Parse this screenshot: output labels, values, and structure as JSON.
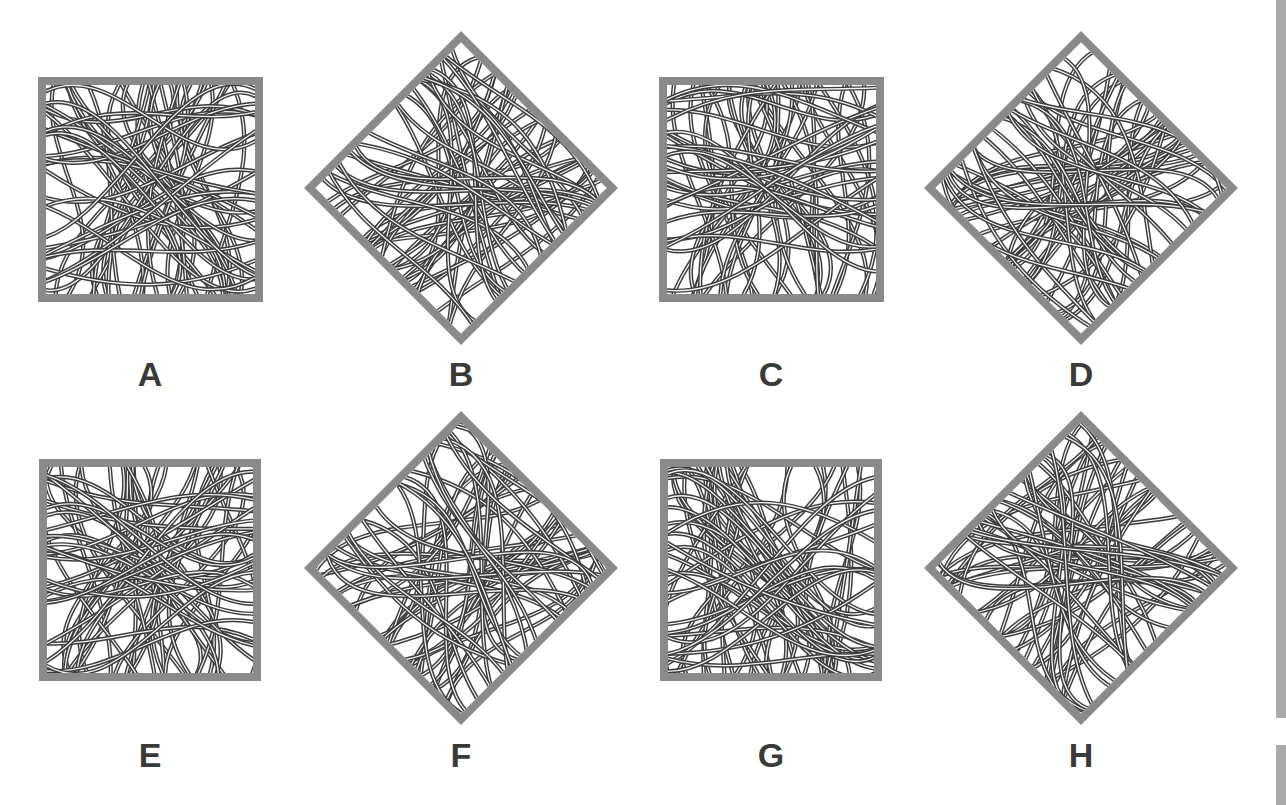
{
  "puzzle": {
    "options": [
      {
        "label": "A",
        "shape": "square",
        "cx": 150,
        "cy": 189,
        "size": 225,
        "seed": 11
      },
      {
        "label": "B",
        "shape": "diamond",
        "cx": 461,
        "cy": 188,
        "size": 222,
        "seed": 23
      },
      {
        "label": "C",
        "shape": "square",
        "cx": 771,
        "cy": 189,
        "size": 225,
        "seed": 37
      },
      {
        "label": "D",
        "shape": "diamond",
        "cx": 1081,
        "cy": 188,
        "size": 222,
        "seed": 41
      },
      {
        "label": "E",
        "shape": "square",
        "cx": 150,
        "cy": 570,
        "size": 222,
        "seed": 53
      },
      {
        "label": "F",
        "shape": "diamond",
        "cx": 461,
        "cy": 568,
        "size": 222,
        "seed": 67
      },
      {
        "label": "G",
        "shape": "square",
        "cx": 771,
        "cy": 570,
        "size": 222,
        "seed": 79
      },
      {
        "label": "H",
        "shape": "diamond",
        "cx": 1081,
        "cy": 568,
        "size": 222,
        "seed": 83
      }
    ],
    "label_positions": {
      "row1_y": 374,
      "row2_y": 755
    },
    "colors": {
      "frame": "#8a8a8a",
      "line_dark": "#3c3c3c",
      "line_light": "#f4f4f4",
      "label": "#3a3a3a",
      "scrollbar": "#a9a9a9"
    }
  },
  "scrollbar": {
    "segments": [
      {
        "top": 0,
        "height": 718
      },
      {
        "top": 745,
        "height": 60
      }
    ]
  }
}
